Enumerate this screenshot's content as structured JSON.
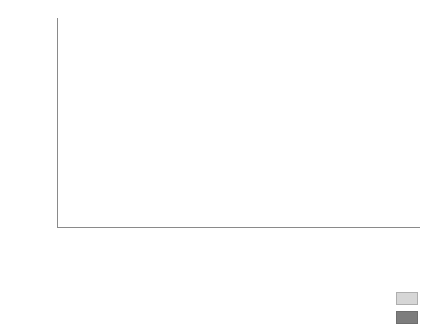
{
  "chart_data": {
    "type": "bar",
    "subtype": "stacked-percentage",
    "title": "",
    "xlabel": "Birth years",
    "ylabel": "",
    "ylim": [
      0,
      100
    ],
    "y_unit": "%",
    "grid": false,
    "legend_position": "bottom-right",
    "y_ticks_major": [
      "0%",
      "20%",
      "40%",
      "60%",
      "80%",
      "100%"
    ],
    "y_tick_values_major": [
      0,
      20,
      40,
      60,
      80,
      100
    ],
    "y_tick_values_minor": [
      10,
      30,
      50,
      70,
      90
    ],
    "categories": [
      "I.M.",
      "D.L.",
      "E.K.",
      "E.L.",
      "M.P.",
      "I.S.",
      "N.C.",
      "S.F.",
      "Vera",
      "V.S.",
      "N.P.",
      "V.O.",
      "E.E.",
      "G.D.",
      "A.E.",
      "V.V.",
      "E.D.",
      "A.P.",
      "N.K.",
      "N.Z.",
      "A.K.",
      "M.S.",
      "Vladimir",
      "V.S.",
      "N.N.",
      "O.P.",
      "D.P.",
      "A.N.",
      "A.I."
    ],
    "series": [
      {
        "name": "ʂ",
        "label": "ʂ",
        "color": "#7d7d7d",
        "values": [
          94,
          100,
          84,
          95,
          72,
          61,
          100,
          100,
          27,
          91,
          62,
          48,
          74,
          81,
          60,
          70,
          19,
          22,
          63,
          0,
          0,
          0,
          84,
          0,
          0,
          0,
          6,
          0,
          0
        ]
      },
      {
        "name": "ʃ:",
        "label": "ʃ:",
        "color": "#d6d6d6",
        "values": [
          6,
          0,
          16,
          5,
          28,
          39,
          0,
          0,
          73,
          9,
          38,
          52,
          26,
          19,
          40,
          30,
          81,
          78,
          37,
          100,
          100,
          100,
          16,
          100,
          100,
          100,
          94,
          100,
          100
        ]
      }
    ],
    "groups": [
      {
        "label": "1910–23",
        "start_index": 0,
        "end_index": 11
      },
      {
        "label": "1929–47",
        "start_index": 12,
        "end_index": 21
      },
      {
        "label": "1960–90",
        "start_index": 22,
        "end_index": 28
      }
    ]
  }
}
